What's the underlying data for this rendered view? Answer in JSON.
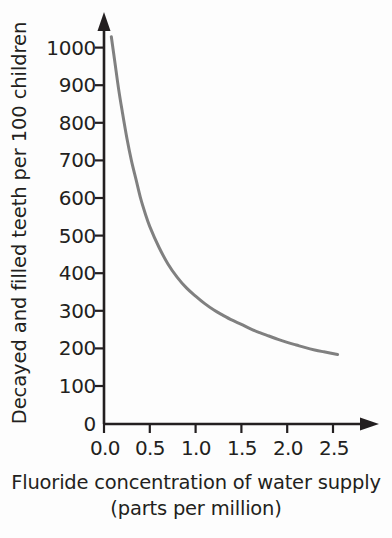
{
  "chart_data": {
    "type": "line",
    "title": "",
    "subtitle": "",
    "xlabel": "Fluoride concentration of water supply (parts per million)",
    "xlabel_lines": [
      "Fluoride concentration of water supply",
      "(parts per million)"
    ],
    "ylabel": "Decayed and filled teeth per 100 children",
    "xlim": [
      0.0,
      2.75
    ],
    "ylim": [
      0,
      1080
    ],
    "xticks": [
      0.0,
      0.5,
      1.0,
      1.5,
      2.0,
      2.5
    ],
    "xtick_labels": [
      "0.0",
      "0.5",
      "1.0",
      "1.5",
      "2.0",
      "2.5"
    ],
    "yticks": [
      0,
      100,
      200,
      300,
      400,
      500,
      600,
      700,
      800,
      900,
      1000
    ],
    "ytick_labels": [
      "0",
      "100",
      "200",
      "300",
      "400",
      "500",
      "600",
      "700",
      "800",
      "900",
      "1000"
    ],
    "grid": false,
    "legend": null,
    "legend_position": "none",
    "axis_style": "arrow-ended L-shaped axes",
    "series": [
      {
        "name": "Decayed and filled teeth",
        "color": "#808080",
        "line_width": 3,
        "marker": "none",
        "x": [
          0.08,
          0.12,
          0.16,
          0.2,
          0.25,
          0.3,
          0.35,
          0.4,
          0.45,
          0.5,
          0.6,
          0.7,
          0.8,
          0.9,
          1.0,
          1.1,
          1.2,
          1.3,
          1.4,
          1.5,
          1.6,
          1.7,
          1.8,
          1.9,
          2.0,
          2.1,
          2.2,
          2.3,
          2.4,
          2.55
        ],
        "y": [
          1030,
          960,
          890,
          830,
          760,
          700,
          650,
          600,
          560,
          525,
          470,
          425,
          390,
          362,
          340,
          320,
          303,
          289,
          276,
          265,
          253,
          243,
          234,
          225,
          217,
          210,
          203,
          197,
          192,
          185
        ]
      }
    ],
    "annotations": [],
    "notable_points": [
      {
        "x": 0.08,
        "y": 1030,
        "note": "curve start near y-axis"
      },
      {
        "x": 0.5,
        "y": 525,
        "note": "value at 0.5 ppm"
      },
      {
        "x": 1.0,
        "y": 340,
        "note": "value at 1.0 ppm"
      },
      {
        "x": 1.5,
        "y": 265,
        "note": "value at 1.5 ppm"
      },
      {
        "x": 2.0,
        "y": 217,
        "note": "value at 2.0 ppm"
      },
      {
        "x": 2.55,
        "y": 185,
        "note": "curve end, plateau"
      }
    ],
    "colors": {
      "curve": "#808080",
      "axis": "#231f20",
      "text": "#231f20",
      "background": "#fdfdfd"
    }
  }
}
